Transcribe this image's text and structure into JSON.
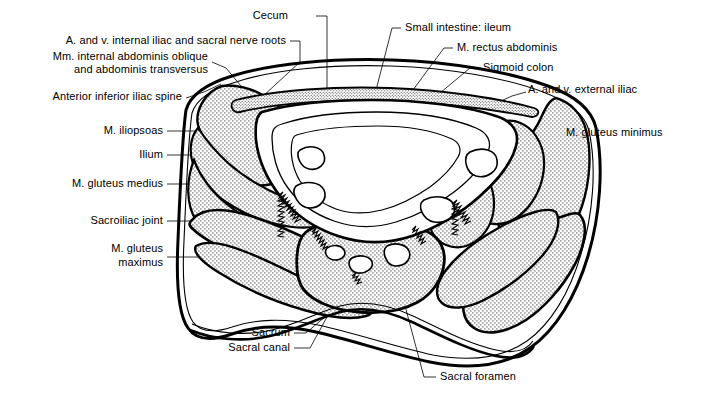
{
  "figure": {
    "type": "anatomical-cross-section",
    "colors": {
      "background": "#ffffff",
      "outline": "#000000",
      "stipple_fill": "#c9c9c9",
      "leader_line": "#000000"
    }
  },
  "labels": [
    {
      "id": "cecum",
      "text": "Cecum",
      "align": "right",
      "x": 288,
      "y": 16,
      "leader": "—"
    },
    {
      "id": "small-intestine",
      "text": "Small intestine: ileum",
      "align": "left",
      "x": 405,
      "y": 28,
      "leader": "—"
    },
    {
      "id": "iliac-nerve-roots",
      "text": "A. and v. internal iliac and sacral nerve roots",
      "align": "right",
      "x": 286,
      "y": 41,
      "leader": "—"
    },
    {
      "id": "rectus-abdominis",
      "text": "M. rectus abdominis",
      "align": "left",
      "x": 457,
      "y": 48,
      "leader": "—"
    },
    {
      "id": "abdominis-oblique",
      "text": "Mm. internal abdominis oblique",
      "align": "right",
      "x": 208,
      "y": 57,
      "leader": ""
    },
    {
      "id": "abdominis-oblique2",
      "text": "and abdominis transversus",
      "align": "right",
      "x": 208,
      "y": 70,
      "leader": ""
    },
    {
      "id": "sigmoid-colon",
      "text": "Sigmoid colon",
      "align": "left",
      "x": 483,
      "y": 68,
      "leader": "—"
    },
    {
      "id": "external-iliac",
      "text": "A. and v. external iliac",
      "align": "left",
      "x": 528,
      "y": 90,
      "leader": ""
    },
    {
      "id": "anterior-iliac-spine",
      "text": "Anterior inferior iliac spine",
      "align": "right",
      "x": 182,
      "y": 97,
      "leader": ""
    },
    {
      "id": "iliopsoas",
      "text": "M. iliopsoas",
      "align": "right",
      "x": 163,
      "y": 131,
      "leader": ""
    },
    {
      "id": "gluteus-minimus",
      "text": "M. gluteus minimus",
      "align": "left",
      "x": 566,
      "y": 133,
      "leader": ""
    },
    {
      "id": "ilium",
      "text": "Ilium",
      "align": "right",
      "x": 163,
      "y": 155,
      "leader": ""
    },
    {
      "id": "gluteus-medius",
      "text": "M. gluteus medius",
      "align": "right",
      "x": 163,
      "y": 184,
      "leader": ""
    },
    {
      "id": "sacroiliac-joint",
      "text": "Sacroiliac joint",
      "align": "right",
      "x": 163,
      "y": 221,
      "leader": ""
    },
    {
      "id": "gluteus-maximus",
      "text": "M. gluteus",
      "align": "right",
      "x": 163,
      "y": 249,
      "leader": ""
    },
    {
      "id": "gluteus-maximus2",
      "text": "maximus",
      "align": "right",
      "x": 163,
      "y": 263,
      "leader": ""
    },
    {
      "id": "sacrum",
      "text": "Sacrum",
      "align": "right",
      "x": 290,
      "y": 333,
      "leader": "—"
    },
    {
      "id": "sacral-canal",
      "text": "Sacral canal",
      "align": "right",
      "x": 290,
      "y": 348,
      "leader": "—"
    },
    {
      "id": "sacral-foramen",
      "text": "Sacral foramen",
      "align": "left",
      "x": 440,
      "y": 377,
      "leader": "—"
    }
  ],
  "structures": [
    {
      "id": "body-outline",
      "name": "body wall outline"
    },
    {
      "id": "left-ilium",
      "name": "left ilium (stippled bone)"
    },
    {
      "id": "right-ilium",
      "name": "right ilium (stippled bone)"
    },
    {
      "id": "sacrum-body",
      "name": "sacrum (stippled bone)"
    },
    {
      "id": "left-gluteus-maximus",
      "name": "left gluteus maximus (stippled muscle)"
    },
    {
      "id": "right-gluteus-maximus",
      "name": "right gluteus maximus (stippled muscle)"
    },
    {
      "id": "bowel-mass",
      "name": "intestinal mass"
    },
    {
      "id": "sacral-foramina",
      "name": "sacral foramina"
    },
    {
      "id": "sacroiliac-joints",
      "name": "sacroiliac joints (jagged line)"
    }
  ]
}
